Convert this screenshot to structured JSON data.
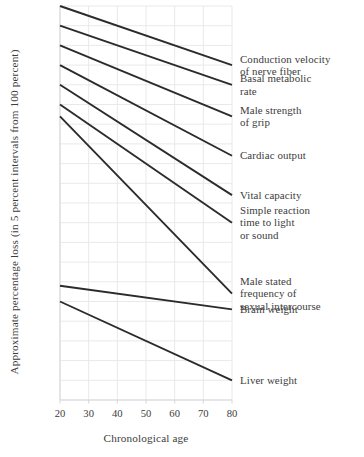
{
  "chart_data": {
    "type": "line",
    "title": "",
    "xlabel": "Chronological age",
    "ylabel": "Approximate percentage loss (in 5 percent intervals from 100 percent)",
    "xlim": [
      20,
      80
    ],
    "ylim": [
      0,
      100
    ],
    "xticks": [
      20,
      30,
      40,
      50,
      60,
      70,
      80
    ],
    "xticklabels": [
      "20",
      "30",
      "40",
      "50",
      "60",
      "70",
      "80"
    ],
    "yticks": [],
    "yticklabels": [],
    "grid": true,
    "legend_position": "right-annotations",
    "x": [
      20,
      80
    ],
    "series": [
      {
        "name": "Conduction velocity of nerve fiber",
        "label": "Conduction velocity\nof nerve fiber",
        "values": [
          100,
          85
        ]
      },
      {
        "name": "Basal metabolic rate",
        "label": "Basal metabolic\nrate",
        "values": [
          95,
          80
        ]
      },
      {
        "name": "Male strength of grip",
        "label": "Male strength\nof grip",
        "values": [
          90,
          72
        ]
      },
      {
        "name": "Cardiac output",
        "label": "Cardiac output",
        "values": [
          85,
          62
        ]
      },
      {
        "name": "Vital capacity",
        "label": "Vital capacity",
        "values": [
          80,
          52
        ]
      },
      {
        "name": "Simple reaction time to light or sound",
        "label": "Simple reaction\ntime to light\nor sound",
        "values": [
          75,
          45
        ]
      },
      {
        "name": "Male stated frequency of sexual intercourse",
        "label": "Male stated\nfrequency of\nsexual intercourse",
        "values": [
          72,
          27
        ]
      },
      {
        "name": "Brain weight",
        "label": "Brain weight",
        "values": [
          29,
          23
        ]
      },
      {
        "name": "Liver weight",
        "label": "Liver weight",
        "values": [
          25,
          5
        ]
      }
    ],
    "colors": {
      "line": "#2b2b2b",
      "grid": "#e9e9ec",
      "axis": "#d8d8dc",
      "text": "#3c3c3c",
      "background": "#ffffff"
    }
  }
}
